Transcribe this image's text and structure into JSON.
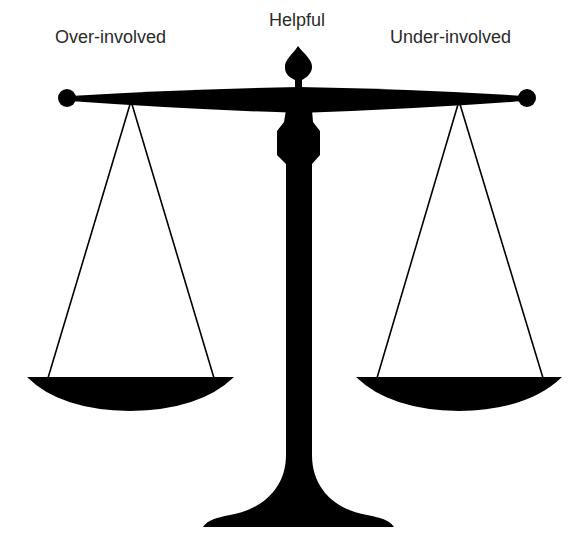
{
  "diagram": {
    "type": "balance-scale",
    "labels": {
      "left": "Over-involved",
      "center": "Helpful",
      "right": "Under-involved"
    },
    "colors": {
      "scale": "#000000",
      "text": "#2a2a2a",
      "background": "#ffffff"
    }
  }
}
